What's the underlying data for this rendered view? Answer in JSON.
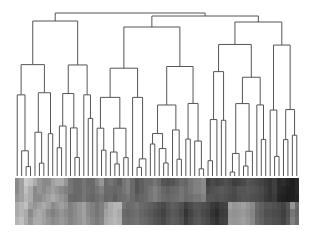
{
  "chart_data": {
    "type": "heatmap",
    "title": "",
    "xlabel": "",
    "ylabel": "",
    "legend": "none",
    "grid": false,
    "n_leaves": 64,
    "n_rows": 6,
    "colormap": "greyscale (light = low, dark = high)",
    "dendrogram": {
      "orientation": "top",
      "root_height_px": 38,
      "top_level_clusters": 3
    },
    "row_profile_darkness": [
      [
        0.45,
        0.35,
        0.15,
        0.2,
        0.3,
        0.4,
        0.45,
        0.45,
        0.35,
        0.3,
        0.3,
        0.4,
        0.55,
        0.6,
        0.6,
        0.55,
        0.6,
        0.6,
        0.5,
        0.4,
        0.6,
        0.55,
        0.6,
        0.65,
        0.55,
        0.5,
        0.6,
        0.7,
        0.65,
        0.6,
        0.6,
        0.55,
        0.6,
        0.7,
        0.72,
        0.7,
        0.65,
        0.6,
        0.62,
        0.55,
        0.5,
        0.5,
        0.45,
        0.8,
        0.75,
        0.78,
        0.75,
        0.72,
        0.75,
        0.8,
        0.78,
        0.75,
        0.7,
        0.72,
        0.75,
        0.78,
        0.82,
        0.85,
        0.8,
        0.9,
        0.88,
        0.92,
        0.95,
        0.9
      ],
      [
        0.45,
        0.35,
        0.2,
        0.3,
        0.45,
        0.4,
        0.45,
        0.4,
        0.35,
        0.4,
        0.45,
        0.5,
        0.55,
        0.6,
        0.6,
        0.55,
        0.58,
        0.6,
        0.55,
        0.5,
        0.6,
        0.6,
        0.62,
        0.6,
        0.55,
        0.5,
        0.6,
        0.7,
        0.65,
        0.6,
        0.55,
        0.5,
        0.55,
        0.62,
        0.65,
        0.62,
        0.6,
        0.55,
        0.6,
        0.55,
        0.5,
        0.5,
        0.45,
        0.75,
        0.72,
        0.7,
        0.68,
        0.7,
        0.72,
        0.75,
        0.7,
        0.7,
        0.68,
        0.7,
        0.72,
        0.75,
        0.8,
        0.85,
        0.8,
        0.9,
        0.92,
        0.95,
        0.95,
        0.9
      ],
      [
        0.4,
        0.35,
        0.25,
        0.3,
        0.45,
        0.45,
        0.4,
        0.35,
        0.3,
        0.35,
        0.4,
        0.45,
        0.6,
        0.62,
        0.6,
        0.55,
        0.6,
        0.62,
        0.58,
        0.55,
        0.62,
        0.6,
        0.65,
        0.6,
        0.58,
        0.55,
        0.6,
        0.65,
        0.62,
        0.6,
        0.55,
        0.5,
        0.55,
        0.6,
        0.62,
        0.6,
        0.58,
        0.55,
        0.6,
        0.58,
        0.55,
        0.55,
        0.5,
        0.7,
        0.7,
        0.72,
        0.7,
        0.72,
        0.74,
        0.76,
        0.72,
        0.7,
        0.7,
        0.72,
        0.74,
        0.76,
        0.82,
        0.85,
        0.82,
        0.92,
        0.94,
        0.96,
        0.95,
        0.92
      ],
      [
        0.3,
        0.25,
        0.2,
        0.35,
        0.4,
        0.35,
        0.3,
        0.35,
        0.45,
        0.4,
        0.35,
        0.4,
        0.5,
        0.45,
        0.4,
        0.35,
        0.45,
        0.5,
        0.55,
        0.5,
        0.4,
        0.3,
        0.25,
        0.25,
        0.55,
        0.6,
        0.58,
        0.55,
        0.6,
        0.62,
        0.65,
        0.68,
        0.72,
        0.75,
        0.7,
        0.65,
        0.68,
        0.72,
        0.8,
        0.75,
        0.7,
        0.7,
        0.72,
        0.75,
        0.82,
        0.85,
        0.8,
        0.78,
        0.35,
        0.4,
        0.38,
        0.35,
        0.4,
        0.45,
        0.6,
        0.65,
        0.7,
        0.7,
        0.72,
        0.75,
        0.78,
        0.7,
        0.4,
        0.6
      ],
      [
        0.3,
        0.25,
        0.3,
        0.45,
        0.35,
        0.3,
        0.35,
        0.45,
        0.5,
        0.45,
        0.4,
        0.45,
        0.5,
        0.45,
        0.4,
        0.35,
        0.45,
        0.5,
        0.55,
        0.5,
        0.35,
        0.3,
        0.25,
        0.3,
        0.6,
        0.62,
        0.6,
        0.58,
        0.62,
        0.65,
        0.68,
        0.72,
        0.75,
        0.78,
        0.72,
        0.68,
        0.7,
        0.75,
        0.85,
        0.78,
        0.72,
        0.7,
        0.75,
        0.78,
        0.85,
        0.9,
        0.82,
        0.8,
        0.4,
        0.42,
        0.4,
        0.38,
        0.42,
        0.48,
        0.62,
        0.66,
        0.72,
        0.72,
        0.74,
        0.76,
        0.8,
        0.72,
        0.55,
        0.62
      ],
      [
        0.25,
        0.2,
        0.3,
        0.4,
        0.3,
        0.3,
        0.35,
        0.4,
        0.45,
        0.42,
        0.38,
        0.42,
        0.48,
        0.44,
        0.4,
        0.35,
        0.42,
        0.48,
        0.52,
        0.48,
        0.32,
        0.28,
        0.24,
        0.28,
        0.58,
        0.6,
        0.58,
        0.56,
        0.6,
        0.62,
        0.66,
        0.7,
        0.72,
        0.76,
        0.7,
        0.66,
        0.68,
        0.72,
        0.82,
        0.76,
        0.7,
        0.68,
        0.72,
        0.76,
        0.82,
        0.86,
        0.8,
        0.78,
        0.38,
        0.4,
        0.38,
        0.36,
        0.4,
        0.46,
        0.6,
        0.64,
        0.7,
        0.7,
        0.72,
        0.74,
        0.78,
        0.7,
        0.5,
        0.6
      ]
    ]
  }
}
